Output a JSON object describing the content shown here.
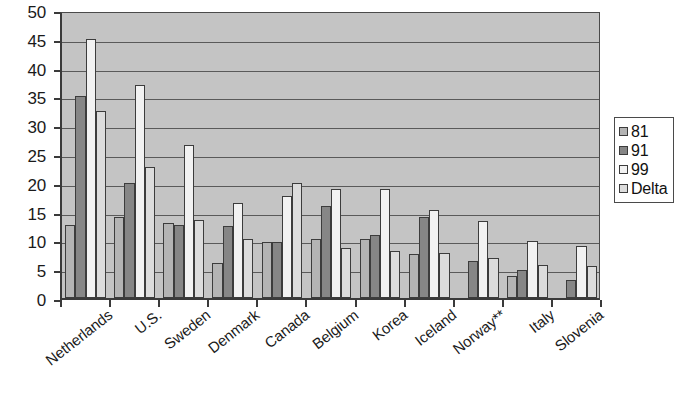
{
  "chart_data": {
    "type": "bar",
    "title": "",
    "subtitle": "",
    "xlabel": "",
    "ylabel": "",
    "ylim": [
      0,
      50
    ],
    "ytick_step": 5,
    "ytick_labels": [
      "0",
      "5",
      "10",
      "15",
      "20",
      "25",
      "30",
      "35",
      "40",
      "45",
      "50"
    ],
    "grid": true,
    "grid_axis": "y",
    "legend_position": "right",
    "orientation": "vertical",
    "categories": [
      "Netherlands",
      "U.S.",
      "Sweden",
      "Denmark",
      "Canada",
      "Belgium",
      "Korea",
      "Iceland",
      "Norway**",
      "Italy",
      "Slovenia"
    ],
    "series": [
      {
        "name": "81",
        "color": "#b4b4b4",
        "values": [
          12.7,
          14.0,
          13.0,
          6.0,
          9.8,
          10.3,
          10.3,
          7.7,
          null,
          3.8,
          null
        ]
      },
      {
        "name": "91",
        "color": "#868686",
        "values": [
          35.0,
          20.0,
          12.7,
          12.5,
          9.8,
          16.0,
          10.9,
          14.0,
          6.5,
          4.8,
          3.2
        ]
      },
      {
        "name": "99",
        "color": "#f2f2f2",
        "values": [
          45.0,
          37.0,
          26.5,
          16.5,
          17.7,
          19.0,
          19.0,
          15.3,
          13.4,
          9.9,
          9.1
        ]
      },
      {
        "name": "Delta",
        "color": "#dcdcdc",
        "values": [
          32.5,
          22.7,
          13.5,
          10.3,
          20.0,
          8.6,
          8.1,
          7.8,
          6.9,
          5.8,
          5.5
        ]
      }
    ]
  },
  "legend": {
    "items": [
      {
        "label": "81",
        "swatch": "#b4b4b4"
      },
      {
        "label": "91",
        "swatch": "#868686"
      },
      {
        "label": "99",
        "swatch": "#f2f2f2"
      },
      {
        "label": "Delta",
        "swatch": "#dcdcdc"
      }
    ]
  },
  "colors": {
    "plot_background": "#c4c4c4",
    "axis": "#3a3a3a",
    "gridline": "#5a5a5a",
    "text": "#1a1a1a",
    "page_background": "#ffffff"
  }
}
